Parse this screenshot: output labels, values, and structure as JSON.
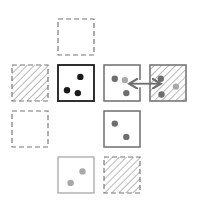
{
  "diagram": {
    "colors": {
      "black": "#1a1a1a",
      "dark_gray": "#555555",
      "mid_gray": "#6e6e6e",
      "light_gray": "#a8a8a8",
      "dashed": "#777777",
      "hatch": "#9a9a9a"
    },
    "cells": [
      {
        "id": "cell-r0-c1",
        "row": 0,
        "col": 1,
        "border": "dashed",
        "hatched": false,
        "dots": []
      },
      {
        "id": "cell-r1-c0",
        "row": 1,
        "col": 0,
        "border": "dashed",
        "hatched": true,
        "dots": []
      },
      {
        "id": "cell-r1-c1",
        "row": 1,
        "col": 1,
        "border": "solid-black",
        "hatched": false,
        "dots": [
          {
            "fx": 0.62,
            "fy": 0.33,
            "tone": "black"
          },
          {
            "fx": 0.25,
            "fy": 0.7,
            "tone": "black"
          },
          {
            "fx": 0.55,
            "fy": 0.78,
            "tone": "black"
          }
        ]
      },
      {
        "id": "cell-r1-c2",
        "row": 1,
        "col": 2,
        "border": "solid-gray-open-right",
        "hatched": false,
        "dots": [
          {
            "fx": 0.3,
            "fy": 0.38,
            "tone": "mid_gray"
          },
          {
            "fx": 0.58,
            "fy": 0.42,
            "tone": "light_gray"
          },
          {
            "fx": 0.62,
            "fy": 0.78,
            "tone": "mid_gray"
          }
        ]
      },
      {
        "id": "cell-r1-c3",
        "row": 1,
        "col": 3,
        "border": "solid-gray",
        "hatched": true,
        "dots": [
          {
            "fx": 0.3,
            "fy": 0.38,
            "tone": "mid_gray"
          },
          {
            "fx": 0.72,
            "fy": 0.6,
            "tone": "light_gray"
          },
          {
            "fx": 0.32,
            "fy": 0.82,
            "tone": "mid_gray"
          }
        ]
      },
      {
        "id": "cell-r2-c0",
        "row": 2,
        "col": 0,
        "border": "dashed",
        "hatched": false,
        "dots": []
      },
      {
        "id": "cell-r2-c2",
        "row": 2,
        "col": 2,
        "border": "solid-gray",
        "hatched": false,
        "dots": [
          {
            "fx": 0.3,
            "fy": 0.35,
            "tone": "mid_gray"
          },
          {
            "fx": 0.62,
            "fy": 0.72,
            "tone": "mid_gray"
          }
        ]
      },
      {
        "id": "cell-r3-c1",
        "row": 3,
        "col": 1,
        "border": "solid-light",
        "hatched": false,
        "dots": [
          {
            "fx": 0.68,
            "fy": 0.4,
            "tone": "light_gray"
          },
          {
            "fx": 0.35,
            "fy": 0.72,
            "tone": "light_gray"
          }
        ]
      },
      {
        "id": "cell-r3-c2",
        "row": 3,
        "col": 2,
        "border": "dashed",
        "hatched": true,
        "dots": []
      }
    ],
    "arrows": [
      {
        "id": "exchange-arrow",
        "from": "cell-r1-c2",
        "to": "cell-r1-c3",
        "type": "double-headed"
      }
    ]
  }
}
